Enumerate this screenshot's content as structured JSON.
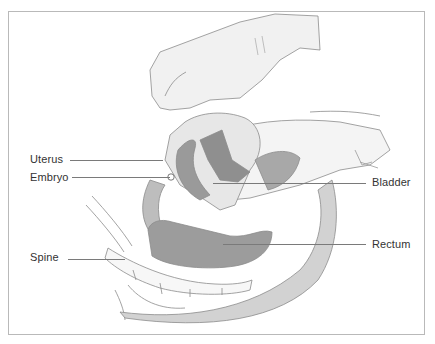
{
  "figure": {
    "labels": [
      {
        "id": "uterus",
        "text": "Uterus",
        "x": 30,
        "y": 153,
        "line": {
          "x1": 70,
          "x2": 163,
          "y": 160
        }
      },
      {
        "id": "embryo",
        "text": "Embryo",
        "x": 30,
        "y": 171,
        "line": {
          "x1": 72,
          "x2": 170,
          "y": 177
        }
      },
      {
        "id": "bladder",
        "text": "Bladder",
        "x": 372,
        "y": 176,
        "line": {
          "x1": 213,
          "x2": 366,
          "y": 183
        }
      },
      {
        "id": "spine",
        "text": "Spine",
        "x": 30,
        "y": 251,
        "line": {
          "x1": 68,
          "x2": 125,
          "y": 259
        }
      },
      {
        "id": "rectum",
        "text": "Rectum",
        "x": 372,
        "y": 238,
        "line": {
          "x1": 223,
          "x2": 366,
          "y": 244
        }
      }
    ],
    "colors": {
      "border": "#b9b9b9",
      "leader": "#7a7a7a",
      "text": "#333333",
      "shade_dark": "#8a8a8a",
      "shade_mid": "#b5b5b5",
      "shade_light": "#e2e2e2"
    }
  }
}
